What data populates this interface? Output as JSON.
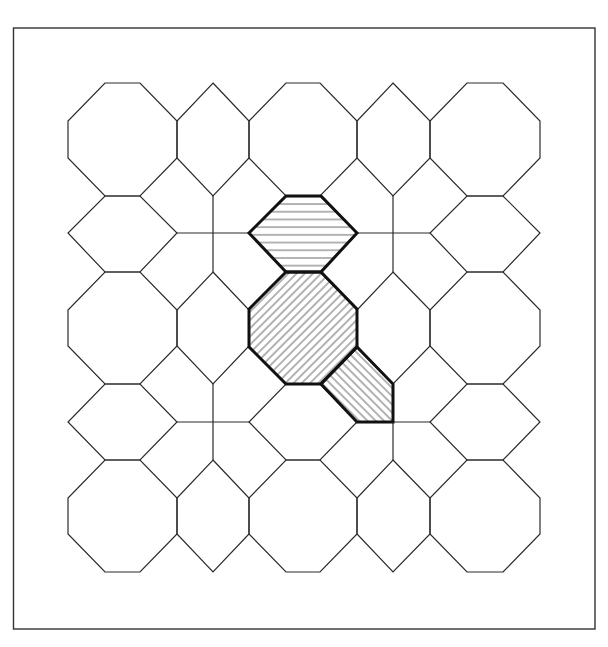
{
  "figure": {
    "title": "Octagon and hexagon tiling with highlighted cells",
    "canvas": {
      "width": 608,
      "height": 647,
      "background": "#ffffff"
    },
    "frame": {
      "x": 13.5,
      "y": 28,
      "width": 581.5,
      "height": 601,
      "stroke": "#333333",
      "stroke_width": 1.4
    },
    "line_color": "#2a2a2a",
    "line_width": 1.2,
    "highlight_stroke_width": 3,
    "highlight_color": "#111111",
    "hatch_color": "#555555"
  },
  "grid": {
    "columns": [
      {
        "type": "octagon",
        "left": 68,
        "right": 177
      },
      {
        "type": "hex",
        "center": 213
      },
      {
        "type": "octagon",
        "left": 249,
        "right": 357
      },
      {
        "type": "hex",
        "center": 393
      },
      {
        "type": "octagon",
        "left": 430,
        "right": 540
      }
    ],
    "rows": [
      {
        "type": "octagon",
        "top": 83,
        "bottom": 196
      },
      {
        "type": "hex",
        "center": 233
      },
      {
        "type": "octagon",
        "top": 272,
        "bottom": 384
      },
      {
        "type": "hex",
        "center": 422
      },
      {
        "type": "octagon",
        "top": 460,
        "bottom": 572
      }
    ],
    "chamfer_x": 37,
    "chamfer_y": 38
  },
  "highlighted_cells": [
    {
      "name": "horizontal-hatched-hexagon",
      "shape": "horizontal-hexagon",
      "row": 1,
      "col": 2,
      "hatch": "horizontal",
      "hatch_spacing": 7.7,
      "points": [
        [
          286,
          196
        ],
        [
          321,
          196
        ],
        [
          357,
          233
        ],
        [
          321,
          272
        ],
        [
          286,
          272
        ],
        [
          249,
          233
        ]
      ]
    },
    {
      "name": "diagonal-hatched-octagon",
      "shape": "octagon",
      "row": 2,
      "col": 2,
      "hatch": "diagonal-up",
      "hatch_spacing": 5.8,
      "points": [
        [
          286,
          272
        ],
        [
          321,
          272
        ],
        [
          357,
          309
        ],
        [
          357,
          347
        ],
        [
          321,
          384
        ],
        [
          286,
          384
        ],
        [
          249,
          347
        ],
        [
          249,
          309
        ]
      ]
    },
    {
      "name": "diagonal-hatched-pentagon",
      "shape": "pentagon",
      "row": 3,
      "col": 3,
      "quadrant": "top-left",
      "hatch": "diagonal-down",
      "hatch_spacing": 5.8,
      "points": [
        [
          357,
          347
        ],
        [
          393,
          384
        ],
        [
          393,
          422
        ],
        [
          357,
          422
        ],
        [
          321,
          384
        ]
      ]
    }
  ]
}
